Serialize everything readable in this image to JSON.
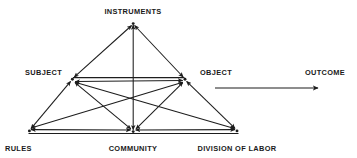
{
  "diagram": {
    "type": "activity-theory-triangle",
    "background_color": "#ffffff",
    "stroke_color": "#1d1d1d",
    "text_color": "#1a1a1a",
    "nodes": [
      {
        "id": "instruments",
        "label": "INSTRUMENTS",
        "x": 133,
        "y": 23,
        "label_x": 133,
        "label_y": 8,
        "label_align": "center"
      },
      {
        "id": "subject",
        "label": "SUBJECT",
        "x": 72,
        "y": 79,
        "label_x": 62,
        "label_y": 69,
        "label_align": "right"
      },
      {
        "id": "object",
        "label": "OBJECT",
        "x": 185,
        "y": 79,
        "label_x": 200,
        "label_y": 69,
        "label_align": "left"
      },
      {
        "id": "rules",
        "label": "RULES",
        "x": 29,
        "y": 131,
        "label_x": 5,
        "label_y": 145,
        "label_align": "left"
      },
      {
        "id": "community",
        "label": "COMMUNITY",
        "x": 133,
        "y": 132,
        "label_x": 133,
        "label_y": 145,
        "label_align": "center"
      },
      {
        "id": "division_of_labor",
        "label": "DIVISION OF LABOR",
        "x": 237,
        "y": 131,
        "label_x": 237,
        "label_y": 145,
        "label_align": "center"
      },
      {
        "id": "outcome",
        "label": "OUTCOME",
        "x": 325,
        "y": 79,
        "label_x": 325,
        "label_y": 69,
        "label_align": "center"
      }
    ],
    "edges": [
      {
        "from": "instruments",
        "to": "subject",
        "direction": "both"
      },
      {
        "from": "instruments",
        "to": "object",
        "direction": "both"
      },
      {
        "from": "instruments",
        "to": "community",
        "direction": "both"
      },
      {
        "from": "subject",
        "to": "object",
        "direction": "both"
      },
      {
        "from": "subject",
        "to": "rules",
        "direction": "both"
      },
      {
        "from": "subject",
        "to": "community",
        "direction": "both"
      },
      {
        "from": "subject",
        "to": "division_of_labor",
        "direction": "both"
      },
      {
        "from": "object",
        "to": "community",
        "direction": "both"
      },
      {
        "from": "object",
        "to": "rules",
        "direction": "both"
      },
      {
        "from": "object",
        "to": "division_of_labor",
        "direction": "both"
      },
      {
        "from": "rules",
        "to": "community",
        "direction": "both"
      },
      {
        "from": "community",
        "to": "division_of_labor",
        "direction": "both"
      },
      {
        "from": "object",
        "to": "outcome",
        "direction": "to"
      }
    ],
    "outcome_arrow": {
      "label": "OUTCOME",
      "start_x": 215,
      "end_x": 320,
      "y": 88
    }
  }
}
